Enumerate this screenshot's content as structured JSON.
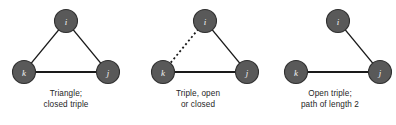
{
  "figure": {
    "width": 396,
    "height": 125,
    "background": "#ffffff",
    "node_fill": "#595959",
    "node_stroke": "#2f2f2f",
    "node_label_color": "#f2f2f2",
    "edge_color": "#1a1a1a",
    "caption_color": "#262626"
  },
  "panels": [
    {
      "id": "triangle-closed-triple",
      "caption_line_1": "Triangle;",
      "caption_line_2": "closed triple",
      "nodes": [
        {
          "id": "i",
          "label": "i",
          "cx": 66,
          "cy": 21,
          "r": 11.5
        },
        {
          "id": "k",
          "label": "k",
          "cx": 24,
          "cy": 72,
          "r": 11.5
        },
        {
          "id": "j",
          "label": "j",
          "cx": 108,
          "cy": 72,
          "r": 11.5
        }
      ],
      "edges": [
        {
          "from": "i",
          "to": "k",
          "style": "solid"
        },
        {
          "from": "i",
          "to": "j",
          "style": "solid"
        },
        {
          "from": "k",
          "to": "j",
          "style": "solid-thick"
        }
      ]
    },
    {
      "id": "triple-open-or-closed",
      "caption_line_1": "Triple, open",
      "caption_line_2": "or closed",
      "nodes": [
        {
          "id": "i",
          "label": "i",
          "cx": 73,
          "cy": 21,
          "r": 11.5
        },
        {
          "id": "k",
          "label": "k",
          "cx": 31,
          "cy": 72,
          "r": 11.5
        },
        {
          "id": "j",
          "label": "j",
          "cx": 115,
          "cy": 72,
          "r": 11.5
        }
      ],
      "edges": [
        {
          "from": "i",
          "to": "k",
          "style": "dashed"
        },
        {
          "from": "i",
          "to": "j",
          "style": "solid"
        },
        {
          "from": "k",
          "to": "j",
          "style": "solid-thick"
        }
      ]
    },
    {
      "id": "open-triple-path-of-length-2",
      "caption_line_1": "Open triple;",
      "caption_line_2": "path of length 2",
      "nodes": [
        {
          "id": "i",
          "label": "i",
          "cx": 74,
          "cy": 21,
          "r": 11.5
        },
        {
          "id": "k",
          "label": "k",
          "cx": 32,
          "cy": 72,
          "r": 11.5
        },
        {
          "id": "j",
          "label": "j",
          "cx": 116,
          "cy": 72,
          "r": 11.5
        }
      ],
      "edges": [
        {
          "from": "i",
          "to": "j",
          "style": "solid"
        },
        {
          "from": "k",
          "to": "j",
          "style": "solid-thick"
        }
      ]
    }
  ]
}
